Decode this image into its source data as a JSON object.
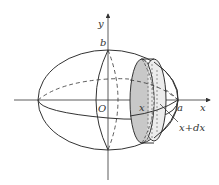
{
  "diagram": {
    "labels": {
      "y_axis": "y",
      "x_axis": "x",
      "b": "b",
      "origin": "O",
      "x_pos": "x",
      "a": "a",
      "x_plus_dx": "x+dx"
    },
    "colors": {
      "stroke": "#333333",
      "slab_fill": "#c8c8c8",
      "slab_face": "#e6e6e6",
      "background": "#ffffff"
    }
  }
}
